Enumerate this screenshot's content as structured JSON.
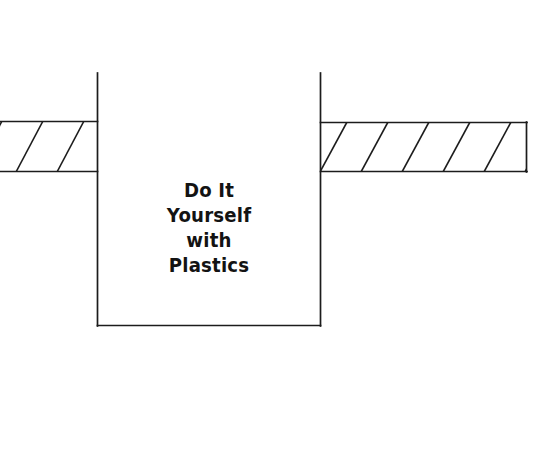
{
  "page": {
    "background_color": "#ffffff",
    "ink_color": "#1c1c1c",
    "text_color": "#131313",
    "width": 555,
    "height": 469
  },
  "title": {
    "lines": [
      "Do It",
      "Yourself",
      "with",
      "Plastics"
    ],
    "full_text": "Do It Yourself with Plastics"
  },
  "figure": {
    "name": "hatched-bar-through-open-rectangle",
    "central_rectangle": {
      "label": "open-top rectangle",
      "x": 97,
      "y": 73,
      "width": 224,
      "height": 253,
      "open_side": "top"
    },
    "left_bar": {
      "label": "hatched bar left segment",
      "x": 0,
      "y": 121,
      "width": 98,
      "height": 51,
      "capped_end": "none",
      "hatch_count": 4,
      "hatch_direction": "up-right"
    },
    "right_bar": {
      "label": "hatched bar right segment",
      "x": 320,
      "y": 122,
      "width": 207,
      "height": 50,
      "capped_end": "right",
      "hatch_count": 5,
      "hatch_direction": "up-right"
    },
    "hatch": {
      "spacing": 41,
      "angle_deg": 62,
      "stroke_width": 1.6
    }
  }
}
